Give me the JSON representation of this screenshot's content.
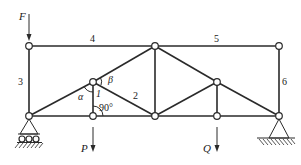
{
  "diagram": {
    "type": "truss",
    "loads": {
      "F": "F",
      "P": "P",
      "Q": "Q"
    },
    "member_labels": {
      "m1": "1",
      "m2": "2",
      "m3": "3",
      "m4": "4",
      "m5": "5",
      "m6": "6"
    },
    "angles": {
      "alpha": "α",
      "beta": "β",
      "right_angle": "90°"
    },
    "supports": {
      "left": "roller",
      "right": "pin"
    },
    "colors": {
      "line": "#2a2a2a",
      "background": "#ffffff"
    }
  }
}
